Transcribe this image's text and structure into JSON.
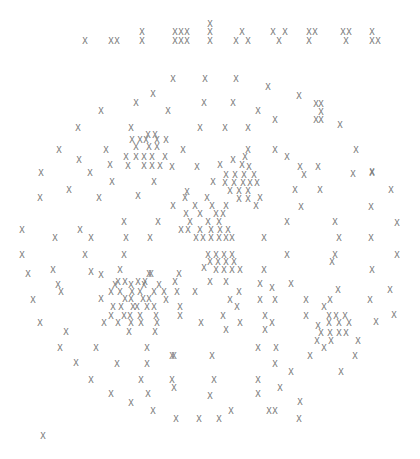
{
  "glyph": "X",
  "color": "#777777",
  "header_row": [
    [
      85,
      41
    ],
    [
      111,
      41
    ],
    [
      117,
      41
    ],
    [
      142,
      32
    ],
    [
      142,
      41
    ],
    [
      175,
      32
    ],
    [
      181,
      32
    ],
    [
      187,
      32
    ],
    [
      175,
      41
    ],
    [
      181,
      41
    ],
    [
      187,
      41
    ],
    [
      210,
      24
    ],
    [
      210,
      32
    ],
    [
      210,
      41
    ],
    [
      242,
      32
    ],
    [
      236,
      41
    ],
    [
      248,
      41
    ],
    [
      273,
      32
    ],
    [
      285,
      32
    ],
    [
      279,
      41
    ],
    [
      309,
      32
    ],
    [
      315,
      32
    ],
    [
      309,
      41
    ],
    [
      343,
      32
    ],
    [
      349,
      32
    ],
    [
      346,
      41
    ],
    [
      372,
      32
    ],
    [
      372,
      41
    ],
    [
      378,
      41
    ]
  ],
  "field": [
    [
      173,
      79
    ],
    [
      205,
      79
    ],
    [
      236,
      79
    ],
    [
      153,
      94
    ],
    [
      268,
      87
    ],
    [
      136,
      103
    ],
    [
      204,
      103
    ],
    [
      233,
      103
    ],
    [
      299,
      96
    ],
    [
      101,
      111
    ],
    [
      168,
      111
    ],
    [
      258,
      111
    ],
    [
      316,
      104
    ],
    [
      321,
      104
    ],
    [
      321,
      112
    ],
    [
      78,
      128
    ],
    [
      131,
      128
    ],
    [
      200,
      128
    ],
    [
      225,
      128
    ],
    [
      248,
      128
    ],
    [
      275,
      120
    ],
    [
      316,
      120
    ],
    [
      321,
      120
    ],
    [
      148,
      135
    ],
    [
      155,
      135
    ],
    [
      340,
      125
    ],
    [
      132,
      140
    ],
    [
      140,
      140
    ],
    [
      146,
      140
    ],
    [
      157,
      140
    ],
    [
      166,
      140
    ],
    [
      59,
      150
    ],
    [
      106,
      150
    ],
    [
      136,
      147
    ],
    [
      149,
      147
    ],
    [
      157,
      147
    ],
    [
      183,
      150
    ],
    [
      248,
      150
    ],
    [
      275,
      150
    ],
    [
      356,
      150
    ],
    [
      126,
      157
    ],
    [
      136,
      157
    ],
    [
      144,
      157
    ],
    [
      152,
      157
    ],
    [
      165,
      157
    ],
    [
      287,
      157
    ],
    [
      79,
      160
    ],
    [
      144,
      166
    ],
    [
      152,
      166
    ],
    [
      160,
      166
    ],
    [
      128,
      166
    ],
    [
      41,
      173
    ],
    [
      90,
      173
    ],
    [
      110,
      165
    ],
    [
      197,
      167
    ],
    [
      220,
      165
    ],
    [
      242,
      165
    ],
    [
      172,
      167
    ],
    [
      300,
      167
    ],
    [
      318,
      167
    ],
    [
      372,
      172
    ],
    [
      233,
      160
    ],
    [
      245,
      157
    ],
    [
      226,
      175
    ],
    [
      235,
      175
    ],
    [
      244,
      175
    ],
    [
      254,
      175
    ],
    [
      249,
      167
    ],
    [
      69,
      190
    ],
    [
      112,
      182
    ],
    [
      154,
      182
    ],
    [
      213,
      182
    ],
    [
      304,
      175
    ],
    [
      353,
      174
    ],
    [
      372,
      173
    ],
    [
      225,
      183
    ],
    [
      234,
      183
    ],
    [
      243,
      183
    ],
    [
      250,
      183
    ],
    [
      257,
      183
    ],
    [
      230,
      191
    ],
    [
      239,
      191
    ],
    [
      248,
      191
    ],
    [
      207,
      198
    ],
    [
      185,
      198
    ],
    [
      295,
      190
    ],
    [
      320,
      190
    ],
    [
      391,
      190
    ],
    [
      260,
      198
    ],
    [
      40,
      198
    ],
    [
      99,
      198
    ],
    [
      138,
      196
    ],
    [
      187,
      192
    ],
    [
      239,
      199
    ],
    [
      248,
      199
    ],
    [
      256,
      206
    ],
    [
      226,
      206
    ],
    [
      173,
      206
    ],
    [
      195,
      206
    ],
    [
      212,
      206
    ],
    [
      186,
      214
    ],
    [
      200,
      214
    ],
    [
      216,
      214
    ],
    [
      223,
      214
    ],
    [
      301,
      207
    ],
    [
      371,
      207
    ],
    [
      22,
      230
    ],
    [
      80,
      230
    ],
    [
      124,
      222
    ],
    [
      158,
      222
    ],
    [
      190,
      222
    ],
    [
      208,
      222
    ],
    [
      219,
      222
    ],
    [
      287,
      222
    ],
    [
      335,
      222
    ],
    [
      397,
      223
    ],
    [
      181,
      230
    ],
    [
      188,
      230
    ],
    [
      200,
      230
    ],
    [
      211,
      230
    ],
    [
      220,
      230
    ],
    [
      228,
      230
    ],
    [
      196,
      238
    ],
    [
      203,
      238
    ],
    [
      211,
      238
    ],
    [
      219,
      238
    ],
    [
      226,
      238
    ],
    [
      232,
      238
    ],
    [
      55,
      238
    ],
    [
      91,
      238
    ],
    [
      126,
      238
    ],
    [
      150,
      238
    ],
    [
      264,
      238
    ],
    [
      339,
      238
    ],
    [
      371,
      238
    ],
    [
      22,
      255
    ],
    [
      85,
      255
    ],
    [
      124,
      255
    ],
    [
      208,
      255
    ],
    [
      216,
      255
    ],
    [
      224,
      255
    ],
    [
      232,
      255
    ],
    [
      287,
      255
    ],
    [
      335,
      255
    ],
    [
      397,
      255
    ],
    [
      53,
      270
    ],
    [
      210,
      262
    ],
    [
      218,
      262
    ],
    [
      226,
      262
    ],
    [
      234,
      262
    ],
    [
      332,
      262
    ],
    [
      28,
      274
    ],
    [
      91,
      272
    ],
    [
      120,
      270
    ],
    [
      151,
      274
    ],
    [
      179,
      274
    ],
    [
      204,
      268
    ],
    [
      216,
      270
    ],
    [
      224,
      270
    ],
    [
      232,
      270
    ],
    [
      240,
      270
    ],
    [
      264,
      270
    ],
    [
      372,
      270
    ],
    [
      58,
      285
    ],
    [
      101,
      275
    ],
    [
      118,
      282
    ],
    [
      125,
      282
    ],
    [
      138,
      282
    ],
    [
      145,
      282
    ],
    [
      149,
      274
    ],
    [
      175,
      282
    ],
    [
      210,
      282
    ],
    [
      226,
      282
    ],
    [
      272,
      288
    ],
    [
      291,
      284
    ],
    [
      338,
      290
    ],
    [
      115,
      285
    ],
    [
      131,
      285
    ],
    [
      144,
      285
    ],
    [
      159,
      285
    ],
    [
      111,
      292
    ],
    [
      120,
      292
    ],
    [
      132,
      292
    ],
    [
      140,
      292
    ],
    [
      154,
      292
    ],
    [
      164,
      292
    ],
    [
      177,
      292
    ],
    [
      195,
      292
    ],
    [
      239,
      292
    ],
    [
      260,
      284
    ],
    [
      33,
      300
    ],
    [
      61,
      292
    ],
    [
      101,
      299
    ],
    [
      125,
      299
    ],
    [
      131,
      299
    ],
    [
      143,
      299
    ],
    [
      149,
      299
    ],
    [
      166,
      300
    ],
    [
      230,
      300
    ],
    [
      260,
      300
    ],
    [
      306,
      300
    ],
    [
      330,
      300
    ],
    [
      370,
      300
    ],
    [
      390,
      290
    ],
    [
      113,
      307
    ],
    [
      121,
      307
    ],
    [
      133,
      307
    ],
    [
      137,
      307
    ],
    [
      147,
      307
    ],
    [
      154,
      307
    ],
    [
      180,
      307
    ],
    [
      237,
      307
    ],
    [
      275,
      300
    ],
    [
      324,
      307
    ],
    [
      394,
      315
    ],
    [
      111,
      316
    ],
    [
      124,
      316
    ],
    [
      130,
      316
    ],
    [
      140,
      316
    ],
    [
      156,
      316
    ],
    [
      180,
      316
    ],
    [
      223,
      316
    ],
    [
      265,
      316
    ],
    [
      306,
      316
    ],
    [
      345,
      316
    ],
    [
      329,
      316
    ],
    [
      336,
      316
    ],
    [
      40,
      323
    ],
    [
      104,
      323
    ],
    [
      118,
      323
    ],
    [
      131,
      323
    ],
    [
      141,
      323
    ],
    [
      157,
      323
    ],
    [
      201,
      323
    ],
    [
      240,
      323
    ],
    [
      272,
      323
    ],
    [
      318,
      326
    ],
    [
      329,
      323
    ],
    [
      339,
      323
    ],
    [
      349,
      323
    ],
    [
      376,
      322
    ],
    [
      66,
      332
    ],
    [
      129,
      332
    ],
    [
      155,
      332
    ],
    [
      226,
      330
    ],
    [
      265,
      330
    ],
    [
      321,
      333
    ],
    [
      330,
      333
    ],
    [
      339,
      333
    ],
    [
      346,
      333
    ],
    [
      317,
      341
    ],
    [
      331,
      341
    ],
    [
      358,
      341
    ],
    [
      60,
      348
    ],
    [
      96,
      348
    ],
    [
      147,
      348
    ],
    [
      174,
      356
    ],
    [
      258,
      348
    ],
    [
      276,
      348
    ],
    [
      324,
      348
    ],
    [
      76,
      363
    ],
    [
      117,
      364
    ],
    [
      147,
      364
    ],
    [
      172,
      356
    ],
    [
      212,
      356
    ],
    [
      275,
      364
    ],
    [
      310,
      356
    ],
    [
      355,
      356
    ],
    [
      91,
      380
    ],
    [
      141,
      380
    ],
    [
      172,
      380
    ],
    [
      214,
      380
    ],
    [
      258,
      380
    ],
    [
      291,
      372
    ],
    [
      341,
      372
    ],
    [
      111,
      394
    ],
    [
      148,
      394
    ],
    [
      174,
      388
    ],
    [
      258,
      394
    ],
    [
      280,
      388
    ],
    [
      131,
      403
    ],
    [
      210,
      396
    ],
    [
      300,
      402
    ],
    [
      153,
      411
    ],
    [
      176,
      419
    ],
    [
      199,
      419
    ],
    [
      219,
      419
    ],
    [
      231,
      411
    ],
    [
      269,
      411
    ],
    [
      299,
      419
    ],
    [
      275,
      411
    ],
    [
      43,
      436
    ]
  ],
  "stray_marks": [
    [
      390,
      400
    ]
  ]
}
